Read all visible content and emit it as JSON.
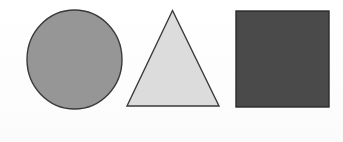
{
  "figure": {
    "background_color": "#fefefe",
    "width": 343,
    "height": 142
  },
  "shapes": [
    {
      "id": "circle",
      "name": "circle",
      "label": "Circle",
      "fill_color": "#969696",
      "stroke_color": "#3a3a3a",
      "stroke_width": 1.4,
      "center_x": 74.5,
      "center_y": 59.5,
      "radius_x": 47.5,
      "radius_y": 49.5
    },
    {
      "id": "triangle",
      "name": "triangle",
      "label": "Triangle",
      "fill_color": "#dcdcdc",
      "stroke_color": "#3a3a3a",
      "stroke_width": 1.4,
      "points": "172.5,10.5 219,106 127,106"
    },
    {
      "id": "rectangle",
      "name": "rectangle",
      "label": "Rectangle",
      "fill_color": "#4a4a4a",
      "stroke_color": "#2a2a2a",
      "stroke_width": 1.4,
      "x": 236,
      "y": 11,
      "width": 93,
      "height": 96
    }
  ]
}
